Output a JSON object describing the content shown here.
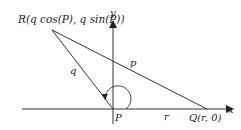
{
  "diagram": {
    "point_R_label": "R(q cos(P), q sin(P))",
    "point_P_label": "P",
    "point_Q_label": "Q(r, 0)",
    "axis_x_label": "x",
    "axis_y_label": "y",
    "side_q_label": "q",
    "side_p_label": "p",
    "side_r_label": "r",
    "colors": {
      "stroke": "#333333",
      "text": "#222222"
    }
  }
}
